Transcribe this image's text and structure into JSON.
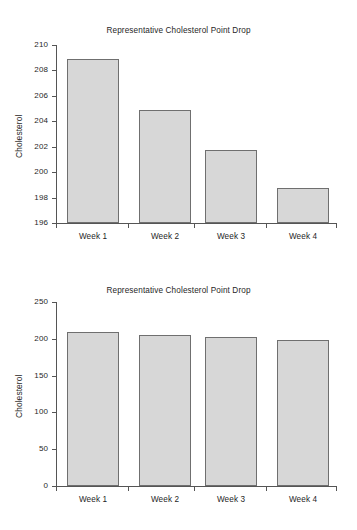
{
  "page": {
    "background_color": "#ffffff",
    "bar_fill_color": "#d7d7d7",
    "bar_border_color": "#6f6f6f",
    "axis_color": "#555555",
    "text_color": "#1f1f1f"
  },
  "chart_data": [
    {
      "id": "top",
      "type": "bar",
      "title": "Representative Cholesterol Point Drop",
      "xlabel": "",
      "ylabel": "Cholesterol",
      "categories": [
        "Week 1",
        "Week 2",
        "Week 3",
        "Week 4"
      ],
      "values": [
        208.9,
        204.85,
        201.75,
        198.75
      ],
      "ylim": [
        196,
        210
      ],
      "yticks": [
        196,
        198,
        200,
        202,
        204,
        206,
        208,
        210
      ],
      "ytick_labels": [
        "196",
        "198",
        "200",
        "202",
        "204",
        "206",
        "208",
        "210"
      ],
      "grid": false,
      "legend": false
    },
    {
      "id": "bottom",
      "type": "bar",
      "title": "Representative Cholesterol Point Drop",
      "xlabel": "",
      "ylabel": "Cholesterol",
      "categories": [
        "Week 1",
        "Week 2",
        "Week 3",
        "Week 4"
      ],
      "values": [
        209,
        205,
        203,
        199
      ],
      "ylim": [
        0,
        250
      ],
      "yticks": [
        0,
        50,
        100,
        150,
        200,
        250
      ],
      "ytick_labels": [
        "0",
        "50",
        "100",
        "150",
        "200",
        "250"
      ],
      "grid": false,
      "legend": false
    }
  ]
}
